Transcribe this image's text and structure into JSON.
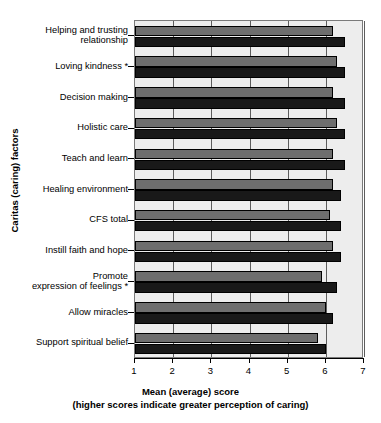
{
  "chart_data": {
    "type": "bar",
    "orientation": "horizontal",
    "title": "",
    "xlabel": "Mean (average) score",
    "xlabel_note": "(higher scores indicate greater perception of caring)",
    "ylabel": "Caritas (caring) factors",
    "xlim": [
      1,
      7
    ],
    "xticks": [
      "1",
      "2",
      "3",
      "4",
      "5",
      "6",
      "7"
    ],
    "grid": true,
    "legend": "none",
    "categories": [
      "Helping and trusting\nrelationship",
      "Loving kindness *",
      "Decision making",
      "Holistic care",
      "Teach and learn",
      "Healing environment",
      "CFS total",
      "Instill faith and hope",
      "Promote\nexpression of feelings *",
      "Allow miracles",
      "Support spiritual belief"
    ],
    "series": [
      {
        "name": "gray",
        "color": "#6e6e6e",
        "values": [
          6.2,
          6.3,
          6.2,
          6.3,
          6.2,
          6.2,
          6.1,
          6.2,
          5.9,
          6.0,
          5.8
        ]
      },
      {
        "name": "black",
        "color": "#191919",
        "values": [
          6.5,
          6.5,
          6.5,
          6.5,
          6.5,
          6.4,
          6.4,
          6.4,
          6.3,
          6.2,
          6.0
        ]
      }
    ]
  },
  "colors": {
    "plot_background": "#ededed",
    "gridline": "#5d5d5d",
    "axis": "#000000",
    "bar_gray": "#6e6e6e",
    "bar_black": "#191919"
  }
}
